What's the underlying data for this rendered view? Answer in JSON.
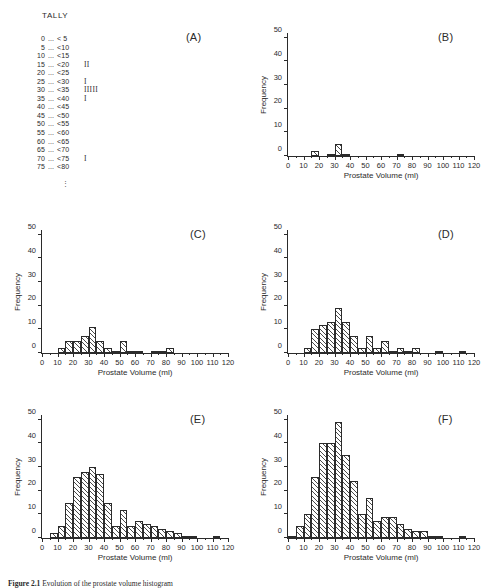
{
  "figure": {
    "caption_prefix": "Figure 2.1",
    "caption_text": "Evolution of the prostate volume histogram",
    "panel_labels": [
      "(A)",
      "(B)",
      "(C)",
      "(D)",
      "(E)",
      "(F)"
    ]
  },
  "tally": {
    "title": "TALLY",
    "dots": "...",
    "ellipsis": "⋮",
    "rows": [
      {
        "lo": "0",
        "hi": "< 5",
        "marks": ""
      },
      {
        "lo": "5",
        "hi": "<10",
        "marks": ""
      },
      {
        "lo": "10",
        "hi": "<15",
        "marks": ""
      },
      {
        "lo": "15",
        "hi": "<20",
        "marks": "II"
      },
      {
        "lo": "20",
        "hi": "<25",
        "marks": ""
      },
      {
        "lo": "25",
        "hi": "<30",
        "marks": "I"
      },
      {
        "lo": "30",
        "hi": "<35",
        "marks": "IIIII"
      },
      {
        "lo": "35",
        "hi": "<40",
        "marks": "I"
      },
      {
        "lo": "40",
        "hi": "<45",
        "marks": ""
      },
      {
        "lo": "45",
        "hi": "<50",
        "marks": ""
      },
      {
        "lo": "50",
        "hi": "<55",
        "marks": ""
      },
      {
        "lo": "55",
        "hi": "<60",
        "marks": ""
      },
      {
        "lo": "60",
        "hi": "<65",
        "marks": ""
      },
      {
        "lo": "65",
        "hi": "<70",
        "marks": ""
      },
      {
        "lo": "70",
        "hi": "<75",
        "marks": "I"
      },
      {
        "lo": "75",
        "hi": "<80",
        "marks": ""
      }
    ]
  },
  "axes": {
    "xlabel": "Prostate Volume (ml)",
    "ylabel": "Frequency",
    "xticks": [
      0,
      10,
      20,
      30,
      40,
      50,
      60,
      70,
      80,
      90,
      100,
      110,
      120
    ],
    "yticks": [
      0,
      10,
      20,
      30,
      40,
      50
    ],
    "xlim": [
      0,
      120
    ],
    "ylim": [
      0,
      52
    ],
    "bin_width": 5
  },
  "chart_data": [
    {
      "type": "bar",
      "panel": "(B)",
      "title": "",
      "xlabel": "Prostate Volume (ml)",
      "ylabel": "Frequency",
      "xlim": [
        0,
        120
      ],
      "ylim": [
        0,
        52
      ],
      "grid": false,
      "bin_width": 5,
      "bin_starts": [
        0,
        5,
        10,
        15,
        20,
        25,
        30,
        35,
        40,
        45,
        50,
        55,
        60,
        65,
        70,
        75,
        80,
        85,
        90,
        95,
        100,
        105,
        110,
        115
      ],
      "values": [
        0,
        0,
        0,
        2,
        0,
        1,
        5,
        1,
        0,
        0,
        0,
        0,
        0,
        0,
        1,
        0,
        0,
        0,
        0,
        0,
        0,
        0,
        0,
        0
      ]
    },
    {
      "type": "bar",
      "panel": "(C)",
      "title": "",
      "xlabel": "Prostate Volume (ml)",
      "ylabel": "Frequency",
      "xlim": [
        0,
        120
      ],
      "ylim": [
        0,
        52
      ],
      "grid": false,
      "bin_width": 5,
      "bin_starts": [
        0,
        5,
        10,
        15,
        20,
        25,
        30,
        35,
        40,
        45,
        50,
        55,
        60,
        65,
        70,
        75,
        80,
        85,
        90,
        95,
        100,
        105,
        110,
        115
      ],
      "values": [
        0,
        0,
        2,
        5,
        5,
        7,
        11,
        5,
        2,
        1,
        5,
        1,
        1,
        0,
        1,
        1,
        2,
        0,
        0,
        0,
        0,
        0,
        0,
        0
      ]
    },
    {
      "type": "bar",
      "panel": "(D)",
      "title": "",
      "xlabel": "Prostate Volume (ml)",
      "ylabel": "Frequency",
      "xlim": [
        0,
        120
      ],
      "ylim": [
        0,
        52
      ],
      "grid": false,
      "bin_width": 5,
      "bin_starts": [
        0,
        5,
        10,
        15,
        20,
        25,
        30,
        35,
        40,
        45,
        50,
        55,
        60,
        65,
        70,
        75,
        80,
        85,
        90,
        95,
        100,
        105,
        110,
        115
      ],
      "values": [
        0,
        0,
        2,
        10,
        12,
        13,
        19,
        13,
        7,
        2,
        7,
        2,
        5,
        1,
        2,
        1,
        2,
        0,
        0,
        1,
        0,
        0,
        1,
        0
      ]
    },
    {
      "type": "bar",
      "panel": "(E)",
      "title": "",
      "xlabel": "Prostate Volume (ml)",
      "ylabel": "Frequency",
      "xlim": [
        0,
        120
      ],
      "ylim": [
        0,
        52
      ],
      "grid": false,
      "bin_width": 5,
      "bin_starts": [
        0,
        5,
        10,
        15,
        20,
        25,
        30,
        35,
        40,
        45,
        50,
        55,
        60,
        65,
        70,
        75,
        80,
        85,
        90,
        95,
        100,
        105,
        110,
        115
      ],
      "values": [
        0,
        2,
        5,
        15,
        26,
        28,
        30,
        27,
        15,
        5,
        12,
        5,
        7,
        6,
        5,
        4,
        3,
        2,
        1,
        1,
        0,
        0,
        1,
        0
      ]
    },
    {
      "type": "bar",
      "panel": "(F)",
      "title": "",
      "xlabel": "Prostate Volume (ml)",
      "ylabel": "Frequency",
      "xlim": [
        0,
        120
      ],
      "ylim": [
        0,
        52
      ],
      "grid": false,
      "bin_width": 5,
      "bin_starts": [
        0,
        5,
        10,
        15,
        20,
        25,
        30,
        35,
        40,
        45,
        50,
        55,
        60,
        65,
        70,
        75,
        80,
        85,
        90,
        95,
        100,
        105,
        110,
        115
      ],
      "values": [
        1,
        5,
        10,
        26,
        40,
        40,
        49,
        35,
        24,
        10,
        17,
        7,
        9,
        9,
        6,
        4,
        3,
        3,
        1,
        1,
        0,
        0,
        1,
        0
      ]
    }
  ],
  "panel_geometry": [
    {
      "panel": "(B)",
      "left": 287,
      "top": 33,
      "plot_w": 186,
      "plot_h": 123,
      "label_x": 438,
      "label_y": 31
    },
    {
      "panel": "(C)",
      "left": 41,
      "top": 230,
      "plot_w": 186,
      "plot_h": 123,
      "label_x": 190,
      "label_y": 228
    },
    {
      "panel": "(D)",
      "left": 287,
      "top": 230,
      "plot_w": 186,
      "plot_h": 123,
      "label_x": 438,
      "label_y": 228
    },
    {
      "panel": "(E)",
      "left": 41,
      "top": 415,
      "plot_w": 186,
      "plot_h": 123,
      "label_x": 190,
      "label_y": 413
    },
    {
      "panel": "(F)",
      "left": 287,
      "top": 415,
      "plot_w": 186,
      "plot_h": 123,
      "label_x": 438,
      "label_y": 413
    }
  ]
}
